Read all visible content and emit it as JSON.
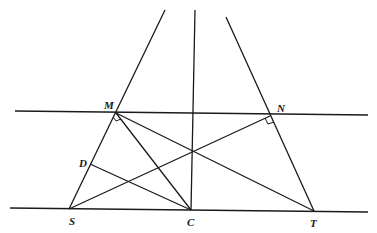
{
  "diagram": {
    "type": "geometry",
    "points": {
      "M": {
        "label": "M",
        "x": 115,
        "y": 112
      },
      "N": {
        "label": "N",
        "x": 270,
        "y": 114
      },
      "S": {
        "label": "S",
        "x": 69,
        "y": 209
      },
      "C": {
        "label": "C",
        "x": 191,
        "y": 210
      },
      "T": {
        "label": "T",
        "x": 314,
        "y": 211
      },
      "D": {
        "label": "D",
        "x": 90,
        "y": 164
      }
    },
    "labels": {
      "M": "M",
      "N": "N",
      "S": "S",
      "C": "C",
      "T": "T",
      "D": "D"
    },
    "lines": [
      {
        "name": "line-MN",
        "desc": "upper horizontal line through M and N"
      },
      {
        "name": "line-ST",
        "desc": "lower horizontal line through S, C, T"
      },
      {
        "name": "ray-SM",
        "desc": "line from S through M extending upward"
      },
      {
        "name": "ray-TN",
        "desc": "line from T through N extending upward"
      },
      {
        "name": "line-vertical-C",
        "desc": "vertical line through C"
      },
      {
        "name": "segment-MC",
        "desc": "segment M to C"
      },
      {
        "name": "segment-MT",
        "desc": "segment M to T"
      },
      {
        "name": "segment-SN",
        "desc": "segment S to N"
      },
      {
        "name": "segment-DC",
        "desc": "segment D to C"
      }
    ],
    "right_angles": [
      "M",
      "N"
    ]
  }
}
